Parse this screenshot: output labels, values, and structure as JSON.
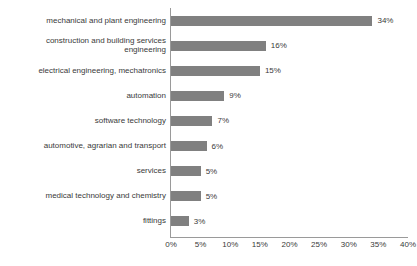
{
  "chart_data": {
    "type": "bar",
    "orientation": "horizontal",
    "title": "",
    "subtitle": "",
    "xlabel": "",
    "ylabel": "",
    "xlim": [
      0,
      40
    ],
    "grid": false,
    "legend": null,
    "bar_color": "#808080",
    "axis_color": "#9a9a9a",
    "text_color": "#3a3a3a",
    "background": "#ffffff",
    "value_suffix": "%",
    "categories": [
      "mechanical and plant engineering",
      "construction and building services\nengineering",
      "electrical engineering, mechatronics",
      "automation",
      "software technology",
      "automotive, agrarian and transport",
      "services",
      "medical technology and chemistry",
      "fittings"
    ],
    "values": [
      34,
      16,
      15,
      9,
      7,
      6,
      5,
      5,
      3
    ],
    "value_labels": [
      "34%",
      "16%",
      "15%",
      "9%",
      "7%",
      "6%",
      "5%",
      "5%",
      "3%"
    ],
    "xticks": [
      0,
      5,
      10,
      15,
      20,
      25,
      30,
      35,
      40
    ],
    "xtick_labels": [
      "0%",
      "5%",
      "10%",
      "15%",
      "20%",
      "25%",
      "30%",
      "35%",
      "40%"
    ]
  }
}
